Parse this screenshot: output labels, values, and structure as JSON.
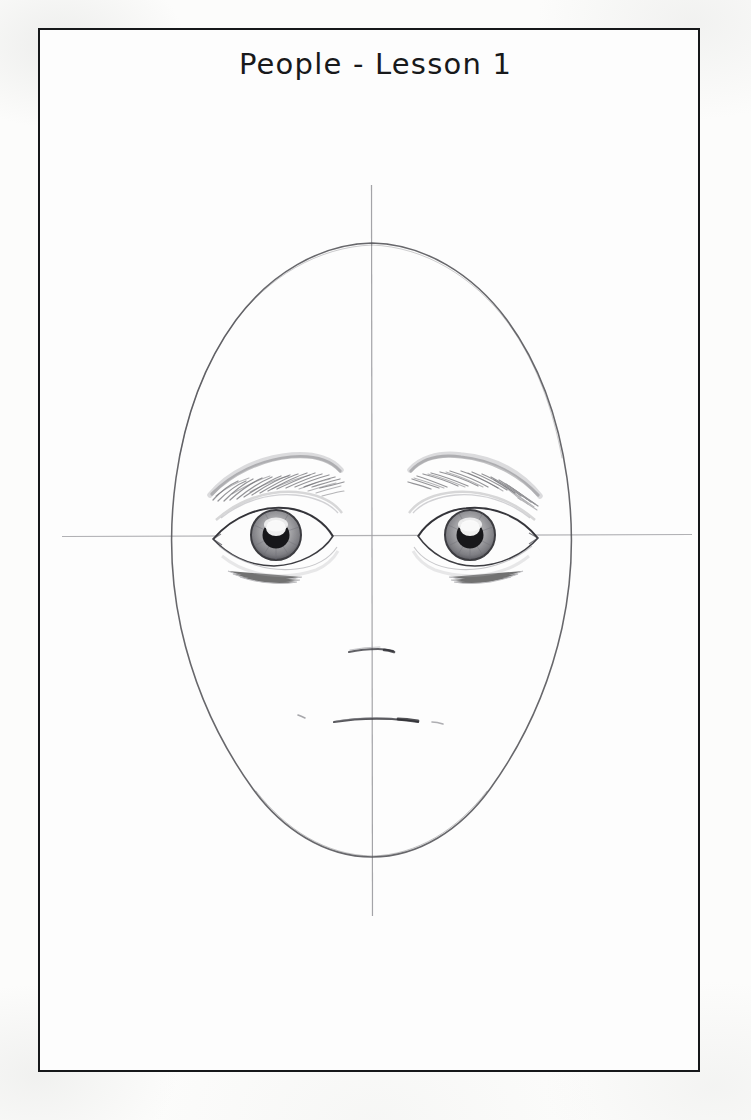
{
  "page": {
    "title": "People - Lesson 1",
    "background_color": "#fcfcfb",
    "frame_color": "#16181a",
    "paper_color": "#fdfdfd"
  },
  "artwork": {
    "name": "pencil-portrait-face-construction",
    "medium": "graphite pencil drawing",
    "subject": "front-facing human head with construction guidelines",
    "pencil_color": "#6a6a6c",
    "dark_pencil_color": "#2b2b2e",
    "guideline_color": "#9a9a9e",
    "elements": [
      {
        "name": "head-outline",
        "label": "head outline oval"
      },
      {
        "name": "vertical-centerline",
        "label": "vertical center guideline"
      },
      {
        "name": "horizontal-eyeline",
        "label": "horizontal eye-level guideline"
      },
      {
        "name": "left-eyebrow",
        "label": "left eyebrow"
      },
      {
        "name": "right-eyebrow",
        "label": "right eyebrow"
      },
      {
        "name": "left-eye",
        "label": "left eye"
      },
      {
        "name": "right-eye",
        "label": "right eye"
      },
      {
        "name": "nose-line",
        "label": "nose base line"
      },
      {
        "name": "mouth-line",
        "label": "mouth line"
      }
    ],
    "geometry": {
      "head_center_x": 372,
      "head_top_y": 242,
      "head_bottom_y": 857,
      "head_left_x": 163,
      "head_right_x": 582,
      "eyeline_y": 536,
      "nose_y": 651,
      "mouth_y": 721,
      "vertical_line_top_y": 185,
      "vertical_line_bottom_y": 916,
      "horizontal_line_left_x": 62,
      "horizontal_line_right_x": 692
    }
  }
}
